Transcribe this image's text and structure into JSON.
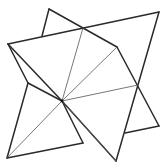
{
  "figure": {
    "width": 162,
    "height": 163,
    "colors": {
      "outline": "#2a2a2a",
      "crease": "#555555",
      "background": "#ffffff"
    },
    "vertices": {
      "A": [
        49,
        9
      ],
      "B": [
        42,
        36
      ],
      "C": [
        83,
        28
      ],
      "D": [
        159,
        12
      ],
      "E": [
        8,
        44
      ],
      "F": [
        117,
        47
      ],
      "G": [
        138,
        85
      ],
      "H": [
        159,
        126
      ],
      "I": [
        125,
        133
      ],
      "J": [
        116,
        161
      ],
      "K": [
        83,
        143
      ],
      "L": [
        7,
        158
      ],
      "M": [
        28,
        83
      ],
      "O": [
        62,
        101
      ]
    },
    "bold_edges": [
      [
        "E",
        "D"
      ],
      [
        "B",
        "A"
      ],
      [
        "A",
        "F"
      ],
      [
        "F",
        "H"
      ],
      [
        "H",
        "I"
      ],
      [
        "D",
        "J"
      ],
      [
        "J",
        "O"
      ],
      [
        "L",
        "K"
      ],
      [
        "K",
        "O"
      ],
      [
        "E",
        "M"
      ],
      [
        "M",
        "L"
      ],
      [
        "M",
        "O"
      ],
      [
        "E",
        "O"
      ]
    ],
    "thin_edges": [
      [
        "O",
        "C"
      ],
      [
        "O",
        "F"
      ],
      [
        "O",
        "G"
      ],
      [
        "O",
        "L"
      ],
      [
        "O",
        "J"
      ]
    ]
  }
}
